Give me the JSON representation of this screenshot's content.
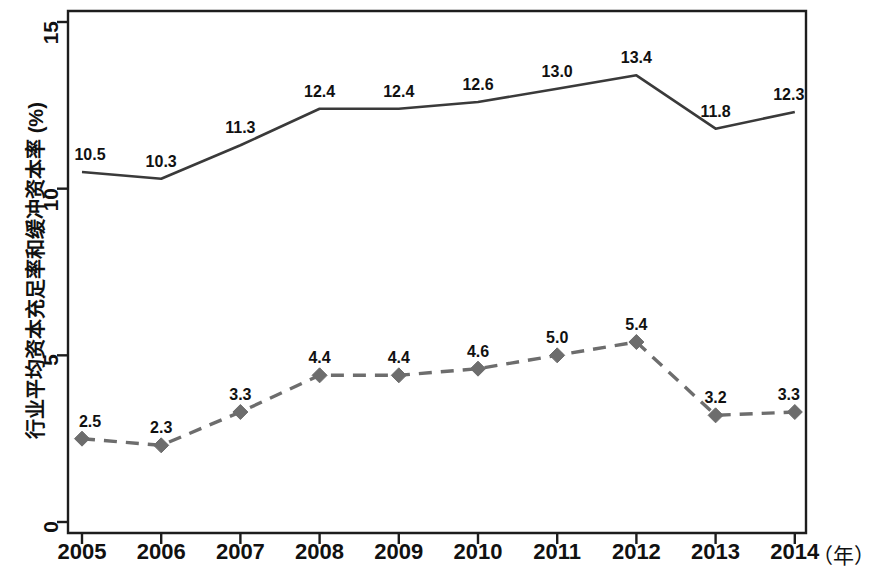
{
  "chart_data": {
    "type": "line",
    "title": "",
    "xlabel": "年",
    "ylabel": "行业平均资本充足率和缓冲资本率 (%)",
    "categories": [
      "2005",
      "2006",
      "2007",
      "2008",
      "2009",
      "2010",
      "2011",
      "2012",
      "2013",
      "2014"
    ],
    "x_tick_labels": [
      "2005",
      "2006",
      "2007",
      "2008",
      "2009",
      "2010",
      "2011",
      "2012",
      "2013",
      "2014"
    ],
    "y_tick_labels": [
      "0",
      "5",
      "10",
      "15"
    ],
    "y_ticks": [
      0,
      5,
      10,
      15
    ],
    "ylim": [
      0,
      15
    ],
    "grid": false,
    "legend": "none",
    "series": [
      {
        "name": "行业平均资本充足率",
        "style": "solid",
        "marker": "none",
        "color": "#3a3a3a",
        "values": [
          10.5,
          10.3,
          11.3,
          12.4,
          12.4,
          12.6,
          13.0,
          13.4,
          11.8,
          12.3
        ],
        "labels": [
          "10.5",
          "10.3",
          "11.3",
          "12.4",
          "12.4",
          "12.6",
          "13.0",
          "13.4",
          "11.8",
          "12.3"
        ]
      },
      {
        "name": "行业平均缓冲资本率",
        "style": "dashed",
        "marker": "diamond",
        "color": "#6d6d6d",
        "values": [
          2.5,
          2.3,
          3.3,
          4.4,
          4.4,
          4.6,
          5.0,
          5.4,
          3.2,
          3.3
        ],
        "labels": [
          "2.5",
          "2.3",
          "3.3",
          "4.4",
          "4.4",
          "4.6",
          "5.0",
          "5.4",
          "3.2",
          "3.3"
        ]
      }
    ]
  },
  "axis": {
    "unit_suffix": "（年）"
  }
}
